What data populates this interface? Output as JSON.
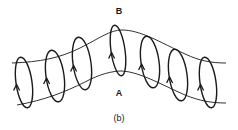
{
  "figure": {
    "panel_label": "(b)",
    "top_label": "B",
    "bottom_label": "A",
    "stroke_color": "#1a1a1a",
    "background": "#ffffff"
  },
  "tube": {
    "upper_edge": "M12,63 C40,62 60,58 80,48 C100,38 110,30 122,30 C140,30 160,42 185,54 C200,61 212,63 226,63",
    "lower_edge": "M17,105 C45,100 65,92 85,82 C100,74 112,71 122,71 C140,72 160,84 185,95 C200,101 212,103 226,103"
  },
  "loops": [
    {
      "cx": 24,
      "top": 57,
      "bottom": 108,
      "rx": 8
    },
    {
      "cx": 55,
      "top": 50,
      "bottom": 102,
      "rx": 9
    },
    {
      "cx": 82,
      "top": 37,
      "bottom": 90,
      "rx": 9
    },
    {
      "cx": 118,
      "top": 25,
      "bottom": 76,
      "rx": 7
    },
    {
      "cx": 150,
      "top": 36,
      "bottom": 88,
      "rx": 9
    },
    {
      "cx": 178,
      "top": 49,
      "bottom": 101,
      "rx": 9
    },
    {
      "cx": 208,
      "top": 57,
      "bottom": 108,
      "rx": 8
    }
  ]
}
